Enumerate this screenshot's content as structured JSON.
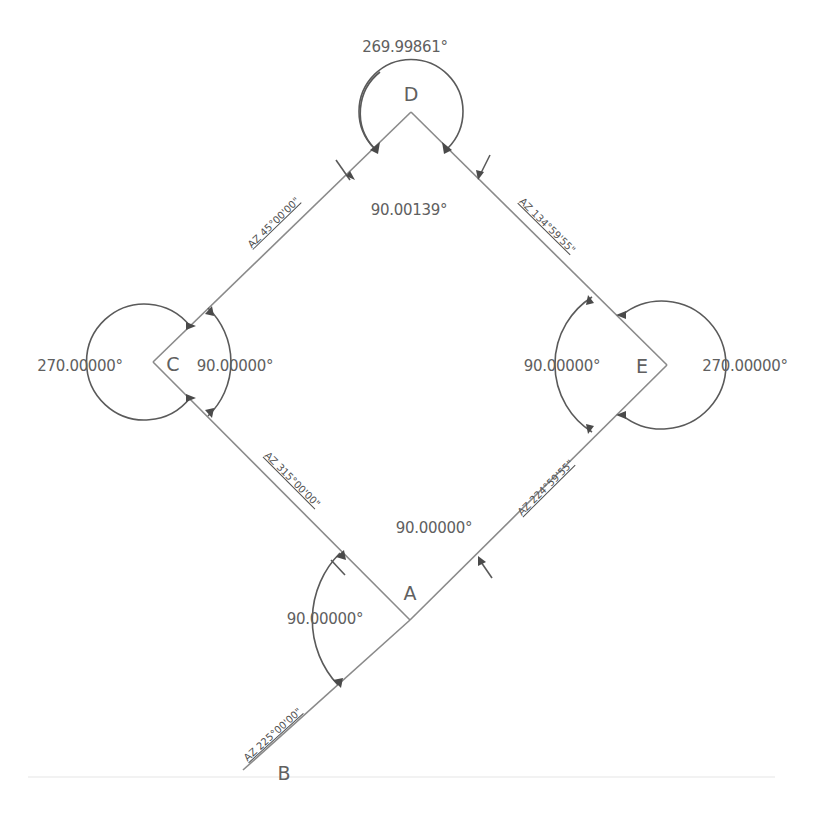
{
  "diagram": {
    "type": "survey traverse",
    "vertices": {
      "A": {
        "label": "A"
      },
      "B": {
        "label": "B"
      },
      "C": {
        "label": "C"
      },
      "D": {
        "label": "D"
      },
      "E": {
        "label": "E"
      }
    },
    "interior_angles": {
      "A": "90.00000°",
      "C": "90.00000°",
      "D": "90.00139°",
      "E": "90.00000°"
    },
    "exterior_angles": {
      "C": "270.00000°",
      "D": "269.99861°",
      "E": "270.00000°"
    },
    "deflection_angle_at_A": "90.00000°",
    "azimuths": {
      "C_to_D": "AZ  45°00'00\"",
      "D_to_E": "AZ  134°59'55\"",
      "E_to_A": "AZ  224°59'55\"",
      "A_to_C": "AZ  315°00'00\"",
      "A_to_B": "AZ  225°00'00\""
    }
  }
}
